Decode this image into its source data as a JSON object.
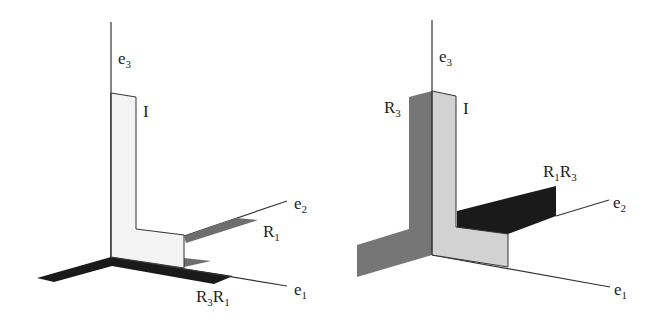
{
  "panels": [
    {
      "id": "left",
      "labels": {
        "e3": {
          "base": "e",
          "sub": "3"
        },
        "e2": {
          "base": "e",
          "sub": "2"
        },
        "e1": {
          "base": "e",
          "sub": "1"
        },
        "identity": "I",
        "r1": {
          "base": "R",
          "sub": "1"
        },
        "r3r1": {
          "base1": "R",
          "sub1": "3",
          "base2": "R",
          "sub2": "1"
        }
      }
    },
    {
      "id": "right",
      "labels": {
        "e3": {
          "base": "e",
          "sub": "3"
        },
        "e2": {
          "base": "e",
          "sub": "2"
        },
        "e1": {
          "base": "e",
          "sub": "1"
        },
        "identity": "I",
        "r3": {
          "base": "R",
          "sub": "3"
        },
        "r1r3": {
          "base1": "R",
          "sub1": "1",
          "base2": "R",
          "sub2": "3"
        }
      }
    }
  ],
  "colors": {
    "light": "#f2f2f2",
    "light_gray": "#d4d4d4",
    "mid_gray": "#6e6e6e",
    "dark_gray": "#7a7a7a",
    "black": "#1a1a1a"
  }
}
